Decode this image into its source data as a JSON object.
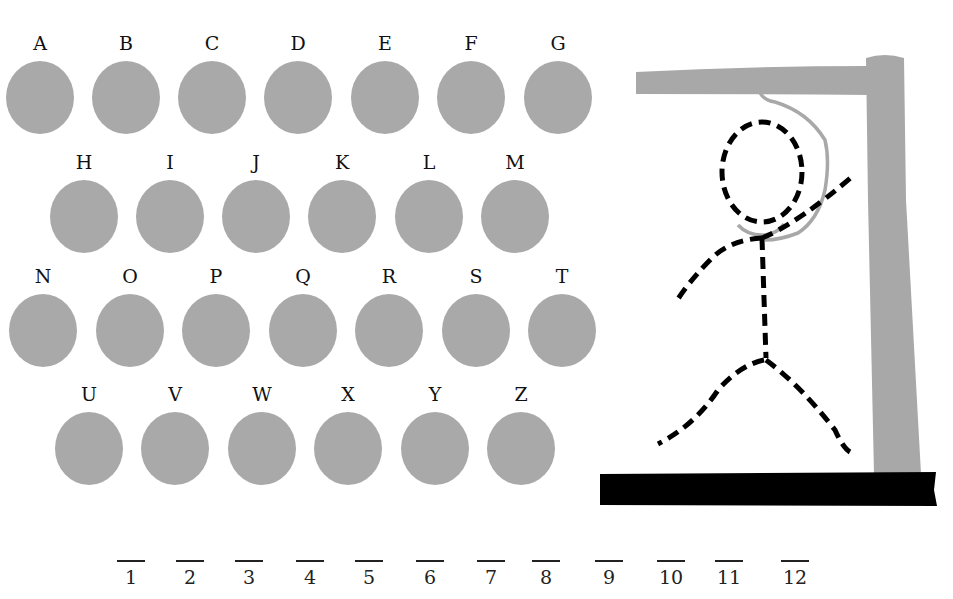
{
  "game": "hangman",
  "letters": [
    {
      "label": "A",
      "x": 5,
      "y": 32
    },
    {
      "label": "B",
      "x": 91,
      "y": 32
    },
    {
      "label": "C",
      "x": 177,
      "y": 32
    },
    {
      "label": "D",
      "x": 263,
      "y": 32
    },
    {
      "label": "E",
      "x": 350,
      "y": 32
    },
    {
      "label": "F",
      "x": 436,
      "y": 32
    },
    {
      "label": "G",
      "x": 523,
      "y": 32
    },
    {
      "label": "H",
      "x": 49,
      "y": 151
    },
    {
      "label": "I",
      "x": 135,
      "y": 151
    },
    {
      "label": "J",
      "x": 221,
      "y": 151
    },
    {
      "label": "K",
      "x": 307,
      "y": 151
    },
    {
      "label": "L",
      "x": 394,
      "y": 151
    },
    {
      "label": "M",
      "x": 480,
      "y": 151
    },
    {
      "label": "N",
      "x": 8,
      "y": 265
    },
    {
      "label": "O",
      "x": 95,
      "y": 265
    },
    {
      "label": "P",
      "x": 181,
      "y": 265
    },
    {
      "label": "Q",
      "x": 268,
      "y": 265
    },
    {
      "label": "R",
      "x": 354,
      "y": 265
    },
    {
      "label": "S",
      "x": 441,
      "y": 265
    },
    {
      "label": "T",
      "x": 527,
      "y": 265
    },
    {
      "label": "U",
      "x": 54,
      "y": 383
    },
    {
      "label": "V",
      "x": 140,
      "y": 383
    },
    {
      "label": "W",
      "x": 227,
      "y": 383
    },
    {
      "label": "X",
      "x": 313,
      "y": 383
    },
    {
      "label": "Y",
      "x": 400,
      "y": 383
    },
    {
      "label": "Z",
      "x": 486,
      "y": 383
    }
  ],
  "slots": [
    {
      "num": "1",
      "x": 131
    },
    {
      "num": "2",
      "x": 190
    },
    {
      "num": "3",
      "x": 249
    },
    {
      "num": "4",
      "x": 310
    },
    {
      "num": "5",
      "x": 369
    },
    {
      "num": "6",
      "x": 430
    },
    {
      "num": "7",
      "x": 491
    },
    {
      "num": "8",
      "x": 546
    },
    {
      "num": "9",
      "x": 609
    },
    {
      "num": "10",
      "x": 671
    },
    {
      "num": "11",
      "x": 729
    },
    {
      "num": "12",
      "x": 795
    }
  ],
  "colors": {
    "disc": "#a9a9a9",
    "gallows": "#a8a8a8",
    "base": "#000000",
    "figure": "#000000"
  }
}
